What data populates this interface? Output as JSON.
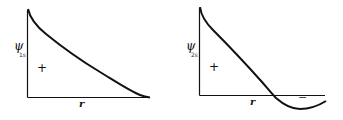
{
  "diagrams": [
    {
      "id": "psi-1s",
      "y_label": "ψ",
      "y_subscript": "1s",
      "x_label": "r",
      "region_sign": "+",
      "description": "Monotonically decaying radial wavefunction, always positive, no node"
    },
    {
      "id": "psi-2s",
      "y_label": "ψ",
      "y_subscript": "2s",
      "x_label": "r",
      "region_sign_positive": "+",
      "region_sign_negative": "−",
      "description": "Radial wavefunction that crosses zero once (one radial node) and becomes negative"
    }
  ],
  "colors": {
    "line": "#111111",
    "background": "#ffffff"
  }
}
